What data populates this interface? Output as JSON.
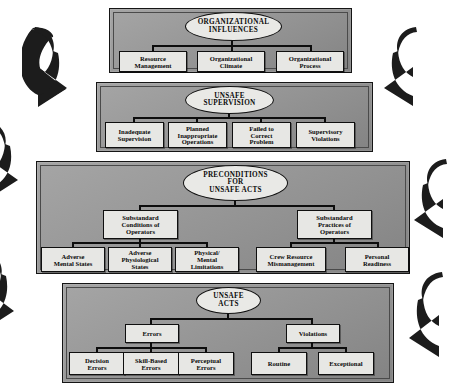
{
  "diagram": {
    "background_color": "#ffffff",
    "panel_fill": "#9a9a9a",
    "node_fill": "#e7e7e4",
    "line_color": "#0d0d0d",
    "arrow_color": "#1a1a1a"
  },
  "tiers": [
    {
      "id": "organizational-influences",
      "head": "ORGANIZATIONAL\nINFLUENCES",
      "head_line1": "ORGANIZATIONAL",
      "head_line2": "INFLUENCES",
      "children": [
        {
          "line1": "Resource",
          "line2": "Management"
        },
        {
          "line1": "Organizational",
          "line2": "Climate"
        },
        {
          "line1": "Organizational",
          "line2": "Process"
        }
      ]
    },
    {
      "id": "unsafe-supervision",
      "head_line1": "UNSAFE",
      "head_line2": "SUPERVISION",
      "children": [
        {
          "line1": "Inadequate",
          "line2": "Supervision",
          "line3": ""
        },
        {
          "line1": "Planned",
          "line2": "Inappropriate",
          "line3": "Operations"
        },
        {
          "line1": "Failed to",
          "line2": "Correct",
          "line3": "Problem"
        },
        {
          "line1": "Supervisory",
          "line2": "Violations",
          "line3": ""
        }
      ]
    },
    {
      "id": "preconditions-for-unsafe-acts",
      "head_line1": "PRECONDITIONS",
      "head_line2": "FOR",
      "head_line3": "UNSAFE ACTS",
      "branches": [
        {
          "id": "substandard-conditions-of-operators",
          "line1": "Substandard",
          "line2": "Conditions of",
          "line3": "Operators",
          "children": [
            {
              "line1": "Adverse",
              "line2": "Mental States",
              "line3": ""
            },
            {
              "line1": "Adverse",
              "line2": "Physiological",
              "line3": "States"
            },
            {
              "line1": "Physical/",
              "line2": "Mental",
              "line3": "Limitations"
            }
          ]
        },
        {
          "id": "substandard-practices-of-operators",
          "line1": "Substandard",
          "line2": "Practices of",
          "line3": "Operators",
          "children": [
            {
              "line1": "Crew Resource",
              "line2": "Mismanagement",
              "line3": ""
            },
            {
              "line1": "Personal",
              "line2": "Readiness",
              "line3": ""
            }
          ]
        }
      ]
    },
    {
      "id": "unsafe-acts",
      "head_line1": "UNSAFE",
      "head_line2": "ACTS",
      "branches": [
        {
          "id": "errors",
          "label": "Errors",
          "children": [
            {
              "line1": "Decision",
              "line2": "Errors"
            },
            {
              "line1": "Skill-Based",
              "line2": "Errors"
            },
            {
              "line1": "Perceptual",
              "line2": "Errors"
            }
          ]
        },
        {
          "id": "violations",
          "label": "Violations",
          "children": [
            {
              "line1": "Routine",
              "line2": ""
            },
            {
              "line1": "Exceptional",
              "line2": ""
            }
          ]
        }
      ]
    }
  ],
  "arrows": [
    {
      "id": "arrow-left-top",
      "side": "left",
      "direction": "down-right"
    },
    {
      "id": "arrow-left-middle",
      "side": "left",
      "direction": "down-right"
    },
    {
      "id": "arrow-left-bottom",
      "side": "left",
      "direction": "down-right"
    },
    {
      "id": "arrow-right-top",
      "side": "right",
      "direction": "down-left"
    },
    {
      "id": "arrow-right-middle",
      "side": "right",
      "direction": "down-left"
    },
    {
      "id": "arrow-right-bottom",
      "side": "right",
      "direction": "down-left"
    }
  ]
}
